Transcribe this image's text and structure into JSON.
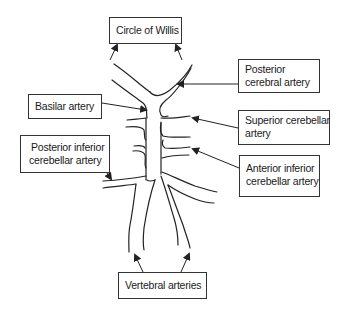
{
  "diagram": {
    "labels": {
      "circle_of_willis": [
        "Circle of Willis"
      ],
      "posterior_cerebral": [
        "Posterior",
        "cerebral artery"
      ],
      "basilar": [
        "Basilar artery"
      ],
      "superior_cerebellar": [
        "Superior cerebellar",
        "artery"
      ],
      "posterior_inferior_cerebellar": [
        "Posterior inferior",
        "cerebellar artery"
      ],
      "anterior_inferior_cerebellar": [
        "Anterior inferior",
        "cerebellar artery"
      ],
      "vertebral": [
        "Vertebral arteries"
      ]
    },
    "colors": {
      "line": "#222222",
      "box_border": "#333333",
      "text": "#1a1a1a",
      "background": "#ffffff"
    }
  }
}
